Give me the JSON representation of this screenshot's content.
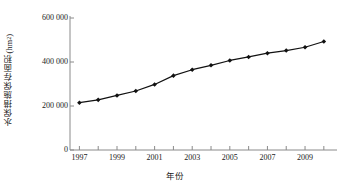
{
  "chart_data": {
    "type": "line",
    "title": "",
    "xlabel": "年份",
    "ylabel": "水保措施保存面积(hm2)",
    "ylabel_base": "水保措施保存面积(hm",
    "ylabel_sup": "2",
    "ylabel_close": ")",
    "x": [
      1997,
      1998,
      1999,
      2000,
      2001,
      2002,
      2003,
      2004,
      2005,
      2006,
      2007,
      2008,
      2009,
      2010
    ],
    "values": [
      215000,
      228000,
      248000,
      268000,
      298000,
      338000,
      365000,
      385000,
      407000,
      423000,
      440000,
      452000,
      467000,
      493000
    ],
    "series": [
      {
        "name": "水保措施保存面积",
        "values": [
          215000,
          228000,
          248000,
          268000,
          298000,
          338000,
          365000,
          385000,
          407000,
          423000,
          440000,
          452000,
          467000,
          493000
        ]
      }
    ],
    "xlim": [
      1996.5,
      2010.7
    ],
    "ylim": [
      0,
      600000
    ],
    "yticks": [
      0,
      200000,
      400000,
      600000
    ],
    "ytick_labels": [
      "0",
      "200 000",
      "400 000",
      "600 000"
    ],
    "xticks": [
      1997,
      1998,
      1999,
      2000,
      2001,
      2002,
      2003,
      2004,
      2005,
      2006,
      2007,
      2008,
      2009,
      2010
    ],
    "xtick_labels_shown": [
      "1997",
      "1999",
      "2001",
      "2003",
      "2005",
      "2007",
      "2009"
    ],
    "xtick_labels_shown_values": [
      1997,
      1999,
      2001,
      2003,
      2005,
      2007,
      2009
    ],
    "grid": false,
    "legend": "none",
    "marker": "diamond",
    "line_color": "#111111",
    "marker_color": "#111111",
    "axis_color": "#8a8a8a",
    "text_color": "#1a1a1a"
  }
}
